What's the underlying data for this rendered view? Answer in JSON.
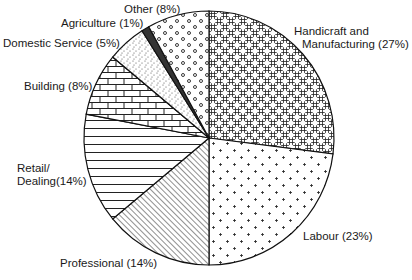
{
  "chart_data": {
    "type": "pie",
    "title": "",
    "start_angle_deg": 0,
    "direction": "clockwise",
    "center": [
      209,
      138
    ],
    "radius": [
      125,
      127
    ],
    "slices": [
      {
        "name": "Handicraft and Manufacturing",
        "value": 27,
        "label_line1": "Handicraft and",
        "label_line2": "Manufacturing (27%)",
        "pattern": "weave"
      },
      {
        "name": "Labour",
        "value": 23,
        "label_line1": "Labour (23%)",
        "label_line2": "",
        "pattern": "plus-dots"
      },
      {
        "name": "Professional",
        "value": 14,
        "label_line1": "Professional (14%)",
        "label_line2": "",
        "pattern": "diagonal"
      },
      {
        "name": "Retail/Dealing",
        "value": 14,
        "label_line1": "Retail/",
        "label_line2": "Dealing(14%)",
        "pattern": "horizontal"
      },
      {
        "name": "Building",
        "value": 8,
        "label_line1": "Building (8%)",
        "label_line2": "",
        "pattern": "brick"
      },
      {
        "name": "Domestic Service",
        "value": 5,
        "label_line1": "Domestic Service (5%)",
        "label_line2": "",
        "pattern": "stipple"
      },
      {
        "name": "Agriculture",
        "value": 1,
        "label_line1": "Agriculture (1%)",
        "label_line2": "",
        "pattern": "solid-dark"
      },
      {
        "name": "Other",
        "value": 8,
        "label_line1": "Other (8%)",
        "label_line2": "",
        "pattern": "circles"
      }
    ]
  },
  "labels": {
    "handicraft": {
      "line1": "Handicraft and",
      "line2": "Manufacturing (27%)"
    },
    "labour": "Labour (23%)",
    "professional": "Professional (14%)",
    "retail": {
      "line1": "Retail/",
      "line2": "Dealing(14%)"
    },
    "building": "Building (8%)",
    "domestic": "Domestic Service (5%)",
    "agriculture": "Agriculture (1%)",
    "other": "Other (8%)"
  }
}
